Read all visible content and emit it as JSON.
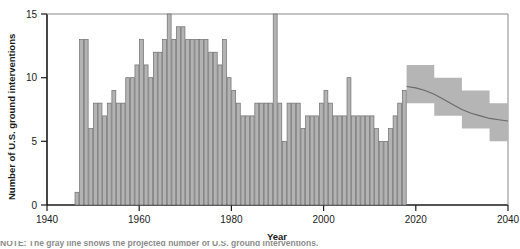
{
  "figure": {
    "axis_x_title": "Year",
    "axis_y_title": "Number of U.S. ground interventions",
    "caption_fragment": "NOTE: The gray line shows the projected number of U.S. ground interventions."
  },
  "chart_data": {
    "type": "bar",
    "title": "",
    "xlabel": "Year",
    "ylabel": "Number of U.S. ground interventions",
    "xlim": [
      1940,
      2040
    ],
    "ylim": [
      0,
      15
    ],
    "xticks": [
      1940,
      1960,
      1980,
      2000,
      2020,
      2040
    ],
    "yticks": [
      0,
      5,
      10,
      15
    ],
    "grid": false,
    "legend": null,
    "bar_color": "#b3b3b3",
    "bar_edge_color": "#6e6e6e",
    "band_color": "#b5b5b5",
    "trend_color": "#6a6a6a",
    "series": [
      {
        "name": "Observed U.S. ground interventions",
        "type": "bar",
        "x": [
          1946,
          1947,
          1948,
          1949,
          1950,
          1951,
          1952,
          1953,
          1954,
          1955,
          1956,
          1957,
          1958,
          1959,
          1960,
          1961,
          1962,
          1963,
          1964,
          1965,
          1966,
          1967,
          1968,
          1969,
          1970,
          1971,
          1972,
          1973,
          1974,
          1975,
          1976,
          1977,
          1978,
          1979,
          1980,
          1981,
          1982,
          1983,
          1984,
          1985,
          1986,
          1987,
          1988,
          1989,
          1990,
          1991,
          1992,
          1993,
          1994,
          1995,
          1996,
          1997,
          1998,
          1999,
          2000,
          2001,
          2002,
          2003,
          2004,
          2005,
          2006,
          2007,
          2008,
          2009,
          2010,
          2011,
          2012,
          2013,
          2014,
          2015,
          2016,
          2017
        ],
        "values": [
          1,
          13,
          13,
          6,
          8,
          8,
          7,
          8,
          9,
          8,
          8,
          10,
          10,
          11,
          13,
          11,
          10,
          12,
          12,
          13,
          15,
          13,
          14,
          14,
          13,
          13,
          13,
          13,
          13,
          12,
          12,
          11,
          13,
          10,
          9,
          8,
          7,
          7,
          7,
          8,
          8,
          8,
          8,
          15,
          8,
          5,
          8,
          8,
          8,
          6,
          7,
          7,
          7,
          8,
          9,
          8,
          7,
          7,
          7,
          10,
          7,
          7,
          7,
          7,
          7,
          6,
          5,
          5,
          6,
          7,
          8,
          9
        ]
      },
      {
        "name": "Projected trend (median)",
        "type": "line",
        "x": [
          2018,
          2020,
          2022,
          2024,
          2026,
          2028,
          2030,
          2032,
          2034,
          2036,
          2038,
          2040
        ],
        "values": [
          9.3,
          9.2,
          9.0,
          8.7,
          8.3,
          7.9,
          7.5,
          7.2,
          7.0,
          6.8,
          6.7,
          6.6
        ]
      },
      {
        "name": "Projection uncertainty band",
        "type": "band",
        "x": [
          2018,
          2021,
          2024,
          2027,
          2030,
          2033,
          2036,
          2040
        ],
        "upper": [
          11.0,
          11.0,
          10.0,
          10.0,
          9.0,
          9.0,
          8.0,
          8.0
        ],
        "lower": [
          8.0,
          8.0,
          7.0,
          7.0,
          6.0,
          6.0,
          5.0,
          5.0
        ]
      }
    ]
  }
}
